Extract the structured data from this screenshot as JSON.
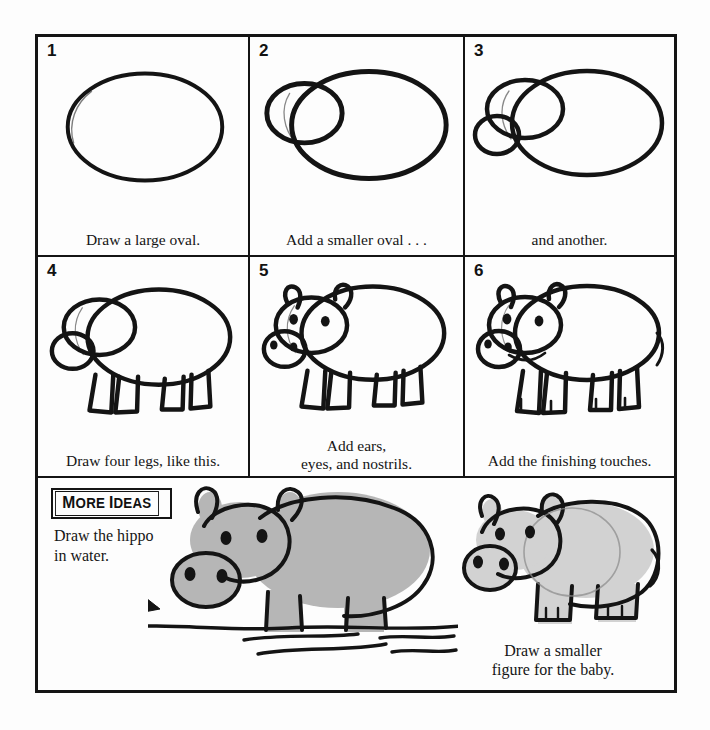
{
  "sheet": {
    "background_color": "#fdfdfd",
    "ink_color": "#141414",
    "shade_color": "#b4b4b4",
    "shade_color_light": "#cfcfcf"
  },
  "steps": [
    {
      "number": "1",
      "caption": "Draw a large oval.",
      "art": "oval-large"
    },
    {
      "number": "2",
      "caption": "Add a smaller oval . . .",
      "art": "oval-plus-head"
    },
    {
      "number": "3",
      "caption": "and another.",
      "art": "oval-plus-head-plus-snout"
    },
    {
      "number": "4",
      "caption": "Draw four legs, like this.",
      "art": "hippo-with-legs"
    },
    {
      "number": "5",
      "caption": "Add ears,\neyes, and nostrils.",
      "art": "hippo-with-features"
    },
    {
      "number": "6",
      "caption": "Add the finishing touches.",
      "art": "hippo-finished"
    }
  ],
  "more_ideas": {
    "badge_first_letter": "M",
    "badge_rest_one": "ORE ",
    "badge_second_letter": "I",
    "badge_rest_two": "DEAS",
    "badge_label": "MORE IDEAS",
    "water_caption": "Draw the hippo\nin water.",
    "baby_caption": "Draw a smaller\nfigure for the baby.",
    "water_art": "hippo-in-water",
    "baby_art": "baby-hippo"
  }
}
